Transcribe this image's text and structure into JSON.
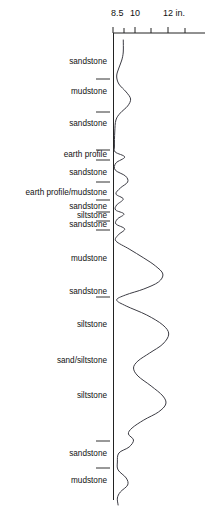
{
  "figure": {
    "title": "",
    "unit_label": "12 in.",
    "axis_top_y": 33
  },
  "scale": {
    "labels": [
      {
        "text": "8.5",
        "x": 111,
        "y": 14
      },
      {
        "text": "10",
        "x": 129,
        "y": 14
      },
      {
        "text": "12 in.",
        "x": 163,
        "y": 14
      }
    ],
    "ticks": [
      {
        "value": "8.5",
        "x": 113
      },
      {
        "value": "9",
        "x": 124
      },
      {
        "value": "10",
        "x": 135
      },
      {
        "value": "11",
        "x": 151
      },
      {
        "value": "12",
        "x": 168
      },
      {
        "value": "13",
        "x": 185
      },
      {
        "value": "14",
        "x": 198
      }
    ],
    "axis_x_start": 113,
    "axis_x_end": 205
  },
  "lithology": {
    "beds": [
      {
        "label": "sandstone",
        "y": 62,
        "boundary_y": 79
      },
      {
        "label": "mudstone",
        "y": 92,
        "boundary_y": 112
      },
      {
        "label": "sandstone",
        "y": 124,
        "boundary_y": 150
      },
      {
        "label": "earth profile",
        "y": 155,
        "boundary_y": 160
      },
      {
        "label": "sandstone",
        "y": 173,
        "boundary_y": 182
      },
      {
        "label": "earth profile/mudstone",
        "y": 193,
        "boundary_y": 200
      },
      {
        "label": "sandstone",
        "y": 207,
        "boundary_y": 212
      },
      {
        "label": "siltstone",
        "y": 216,
        "boundary_y": 221
      },
      {
        "label": "sandstone",
        "y": 225,
        "boundary_y": 230
      },
      {
        "label": "mudstone",
        "y": 259,
        "boundary_y": null
      },
      {
        "label": "sandstone",
        "y": 292,
        "boundary_y": 297
      },
      {
        "label": "siltstone",
        "y": 325,
        "boundary_y": null
      },
      {
        "label": "sand/siltstone",
        "y": 361,
        "boundary_y": null
      },
      {
        "label": "siltstone",
        "y": 396,
        "boundary_y": null
      },
      {
        "label": "sandstone",
        "y": 454,
        "boundary_y": 441
      },
      {
        "label": "mudstone",
        "y": 481,
        "boundary_y": 468
      }
    ]
  },
  "chart_data": {
    "type": "line",
    "xlabel": "12 in.",
    "ylabel": "",
    "xlim": [
      8.5,
      14.0
    ],
    "ylim": [
      0,
      514
    ],
    "grid": false,
    "legend": null,
    "orientation": "vertical-depth",
    "x_tick_labels": [
      "8.5",
      "10",
      "12 in."
    ],
    "x_tick_values": [
      8.5,
      9,
      10,
      11,
      12,
      13,
      14
    ],
    "series": [
      {
        "name": "caliper",
        "comment": "hole diameter in inches versus depth; x = inches, y = pixel depth",
        "points": [
          [
            9.2,
            40
          ],
          [
            9.2,
            52
          ],
          [
            9.1,
            60
          ],
          [
            8.9,
            68
          ],
          [
            8.75,
            76
          ],
          [
            8.9,
            84
          ],
          [
            9.4,
            92
          ],
          [
            9.7,
            99
          ],
          [
            9.5,
            106
          ],
          [
            9.0,
            113
          ],
          [
            8.7,
            120
          ],
          [
            8.62,
            132
          ],
          [
            8.6,
            146
          ],
          [
            8.65,
            152
          ],
          [
            9.3,
            157
          ],
          [
            8.7,
            163
          ],
          [
            8.65,
            170
          ],
          [
            9.35,
            176
          ],
          [
            9.5,
            182
          ],
          [
            9.0,
            188
          ],
          [
            8.7,
            194
          ],
          [
            9.2,
            199
          ],
          [
            8.75,
            205
          ],
          [
            8.68,
            210
          ],
          [
            9.25,
            214
          ],
          [
            8.8,
            219
          ],
          [
            8.7,
            224
          ],
          [
            9.3,
            229
          ],
          [
            8.85,
            235
          ],
          [
            8.7,
            241
          ],
          [
            9.6,
            249
          ],
          [
            10.6,
            258
          ],
          [
            11.4,
            266
          ],
          [
            11.9,
            274
          ],
          [
            11.6,
            282
          ],
          [
            10.6,
            289
          ],
          [
            9.35,
            295
          ],
          [
            8.75,
            300
          ],
          [
            9.4,
            306
          ],
          [
            10.8,
            315
          ],
          [
            11.9,
            325
          ],
          [
            12.3,
            334
          ],
          [
            11.9,
            344
          ],
          [
            11.0,
            353
          ],
          [
            10.2,
            361
          ],
          [
            9.9,
            368
          ],
          [
            10.2,
            376
          ],
          [
            11.1,
            386
          ],
          [
            11.9,
            396
          ],
          [
            12.1,
            404
          ],
          [
            11.6,
            412
          ],
          [
            10.6,
            420
          ],
          [
            9.8,
            428
          ],
          [
            9.55,
            434
          ],
          [
            9.9,
            440
          ],
          [
            9.6,
            447
          ],
          [
            8.9,
            453
          ],
          [
            8.8,
            462
          ],
          [
            8.85,
            470
          ],
          [
            9.4,
            478
          ],
          [
            9.5,
            485
          ],
          [
            9.0,
            492
          ],
          [
            8.8,
            498
          ],
          [
            8.85,
            505
          ]
        ]
      }
    ]
  },
  "colors": {
    "curve": "#3c3c44",
    "axis": "#222222",
    "text": "#111111",
    "background": "#ffffff"
  }
}
